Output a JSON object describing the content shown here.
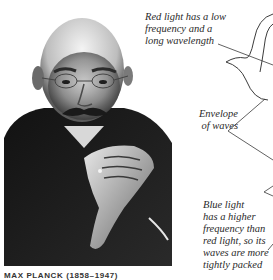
{
  "annotations": {
    "red_light": {
      "line1": "Red light has a low",
      "line2": "frequency and a",
      "line3": "long wavelength"
    },
    "envelope": {
      "line1": "Envelope",
      "line2": "of waves"
    },
    "blue_light": {
      "line1": "Blue light",
      "line2": "has a higher",
      "line3": "frequency than",
      "line4": "red light, so its",
      "line5": "waves are more",
      "line6": "tightly packed"
    }
  },
  "photo": {
    "subject": "portrait of elderly man with glasses and moustache, hands clasped",
    "style": "black-and-white"
  },
  "caption": {
    "text": "MAX PLANCK (1858–1947)"
  },
  "colors": {
    "background": "#ffffff",
    "text": "#2a2a2a",
    "lines": "#3a3a3a"
  }
}
